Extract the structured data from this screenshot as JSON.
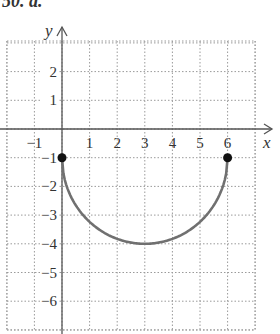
{
  "header": {
    "text": "50. a."
  },
  "chart_data": {
    "type": "line",
    "title": "",
    "xlabel": "x",
    "ylabel": "y",
    "xlim": [
      -2,
      7.5
    ],
    "ylim": [
      -7,
      3
    ],
    "grid": true,
    "x_ticks": [
      -1,
      1,
      2,
      3,
      4,
      5,
      6
    ],
    "y_ticks": [
      2,
      1,
      -1,
      -2,
      -3,
      -4,
      -5,
      -6
    ],
    "series": [
      {
        "name": "lower semicircle, center (3,-1), radius 3",
        "equation": "y = -1 - sqrt(9 - (x-3)^2)",
        "x": [
          0,
          0.5,
          1,
          1.5,
          2,
          2.5,
          3,
          3.5,
          4,
          4.5,
          5,
          5.5,
          6
        ],
        "y": [
          -1,
          -2.66,
          -3.24,
          -3.6,
          -3.83,
          -3.96,
          -4,
          -3.96,
          -3.83,
          -3.6,
          -3.24,
          -2.66,
          -1
        ],
        "color": "#707070"
      }
    ],
    "endpoints": [
      {
        "x": 0,
        "y": -1,
        "style": "closed"
      },
      {
        "x": 6,
        "y": -1,
        "style": "closed"
      }
    ]
  },
  "labels": {
    "x_axis": "x",
    "y_axis": "y",
    "x_ticks": [
      "−1",
      "1",
      "2",
      "3",
      "4",
      "5",
      "6"
    ],
    "y_ticks": [
      "2",
      "1",
      "−1",
      "−2",
      "−3",
      "−4",
      "−5",
      "−6"
    ]
  }
}
